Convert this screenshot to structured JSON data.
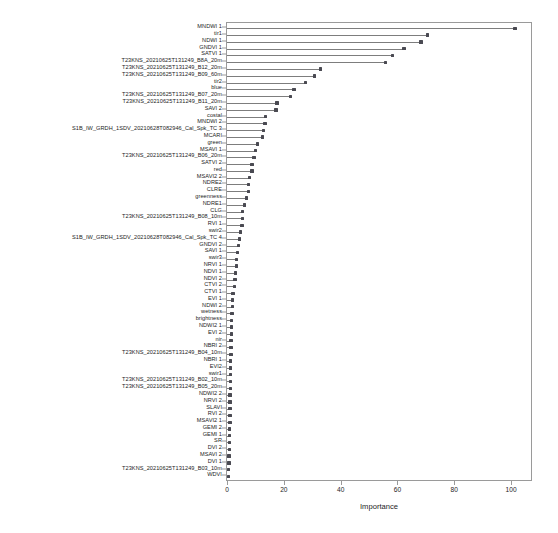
{
  "chart_data": {
    "type": "bar",
    "title": "",
    "subtitle": "",
    "xlabel": "Importance",
    "ylabel": "",
    "xlim": [
      0,
      107
    ],
    "ylim": [
      0,
      79
    ],
    "grid": false,
    "legend": null,
    "orientation": "horizontal",
    "style": "lollipop",
    "xticks": [
      0,
      20,
      40,
      60,
      80,
      100
    ],
    "xticklabels": [
      "0",
      "20",
      "40",
      "60",
      "80",
      "100"
    ],
    "accent_color": "#4a4a52",
    "stem_color": "#7d7d7d",
    "axis_color": "#9a9a9a",
    "categories": [
      "MNDWI 1",
      "tir1",
      "NDWI 1",
      "GNDVI 1",
      "SATVI 1",
      "T23KNS_20210625T131249_B8A_20m",
      "T23KNS_20210625T131249_B12_20m",
      "T23KNS_20210625T131249_B09_60m",
      "tir2",
      "blue",
      "T23KNS_20210625T131249_B07_20m",
      "T23KNS_20210625T131249_B11_20m",
      "SAVI 2",
      "costal",
      "MNDWI 2",
      "S1B_IW_GRDH_1SDV_20210628T082946_Cal_Spk_TC 3",
      "MCARI",
      "green",
      "MSAVI 1",
      "T23KNS_20210625T131249_B06_20m",
      "SATVI 2",
      "red",
      "MSAVI2 2",
      "NDRE2",
      "CLRE",
      "greenness",
      "NDRE1",
      "CLG",
      "T23KNS_20210625T131249_B08_10m",
      "RVI 1",
      "swir2",
      "S1B_IW_GRDH_1SDV_20210628T082946_Cal_Spk_TC 4",
      "GNDVI 2",
      "SAVI 1",
      "swir3",
      "NRVI 1",
      "NDVI 1",
      "NDVI 2",
      "CTVI 2",
      "CTVI 1",
      "EVI 1",
      "NDWI 2",
      "wetness",
      "brightness",
      "NDWI2 1",
      "EVI 2",
      "nir",
      "NBRI 2",
      "T23KNS_20210625T131249_B04_10m",
      "NBRI 1",
      "EVI2",
      "swir1",
      "T23KNS_20210625T131249_B02_10m",
      "T23KNS_20210625T131249_B05_20m",
      "NDWI2 2",
      "NRVI 2",
      "SLAVI",
      "RVI 2",
      "MSAVI2 1",
      "GEMI 2",
      "GEMI 1",
      "SR",
      "DVI 2",
      "MSAVI 2",
      "DVI 1",
      "T23KNS_20210625T131249_B03_10m",
      "WDVI"
    ],
    "values": [
      101.0,
      70.3,
      68.0,
      62.0,
      58.0,
      55.4,
      32.5,
      30.5,
      27.2,
      23.2,
      22.1,
      17.2,
      16.9,
      13.3,
      13.0,
      12.6,
      12.2,
      10.3,
      9.7,
      9.1,
      8.5,
      8.5,
      7.6,
      7.3,
      7.3,
      6.6,
      5.8,
      5.2,
      5.0,
      4.9,
      4.4,
      4.1,
      3.7,
      3.4,
      3.1,
      2.9,
      2.7,
      2.4,
      2.2,
      1.7,
      1.6,
      1.5,
      1.4,
      1.3,
      1.2,
      1.15,
      1.1,
      1.05,
      1.0,
      0.95,
      0.9,
      0.85,
      0.8,
      0.78,
      0.75,
      0.72,
      0.7,
      0.68,
      0.65,
      0.6,
      0.55,
      0.5,
      0.45,
      0.4,
      0.34,
      0.28,
      0.2
    ]
  }
}
